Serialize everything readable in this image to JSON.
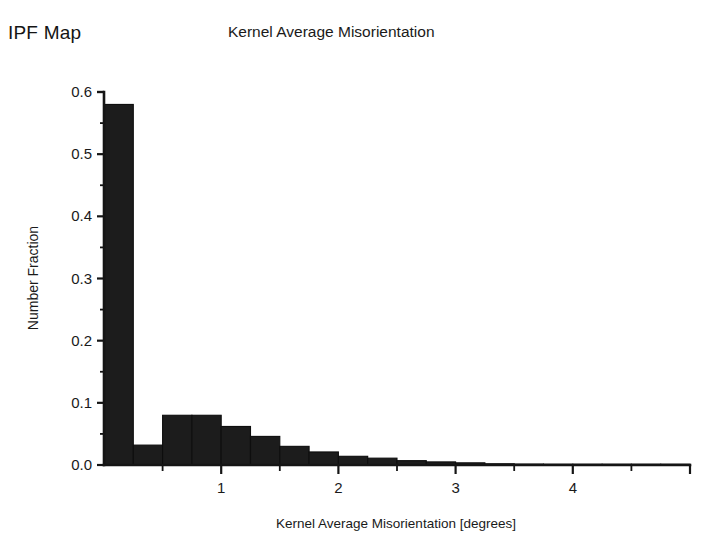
{
  "figure": {
    "panel_label": "IPF Map",
    "title": "Kernel Average Misorientation"
  },
  "chart_data": {
    "type": "bar",
    "title": "Kernel Average Misorientation",
    "xlabel": "Kernel Average Misorientation [degrees]",
    "ylabel": "Number Fraction",
    "xlim": [
      0,
      5
    ],
    "ylim": [
      0,
      0.6
    ],
    "grid": false,
    "legend": null,
    "bar_width": 0.25,
    "x_major_ticks": [
      1,
      2,
      3,
      4
    ],
    "x_major_tick_labels": [
      "1",
      "2",
      "3",
      "4"
    ],
    "x_minor_ticks": [
      0.5,
      1.5,
      2.5,
      3.5,
      4.5
    ],
    "y_major_ticks": [
      0.0,
      0.1,
      0.2,
      0.3,
      0.4,
      0.5,
      0.6
    ],
    "y_major_tick_labels": [
      "0.0",
      "0.1",
      "0.2",
      "0.3",
      "0.4",
      "0.5",
      "0.6"
    ],
    "y_minor_ticks": [
      0.05,
      0.15,
      0.25,
      0.35,
      0.45,
      0.55
    ],
    "bin_edges": [
      0.0,
      0.25,
      0.5,
      0.75,
      1.0,
      1.25,
      1.5,
      1.75,
      2.0,
      2.25,
      2.5,
      2.75,
      3.0,
      3.25,
      3.5,
      3.75,
      4.0,
      4.25,
      4.5,
      4.75,
      5.0
    ],
    "categories": [
      "0.125",
      "0.375",
      "0.625",
      "0.875",
      "1.125",
      "1.375",
      "1.625",
      "1.875",
      "2.125",
      "2.375",
      "2.625",
      "2.875",
      "3.125",
      "3.375",
      "3.625",
      "3.875",
      "4.125",
      "4.375",
      "4.625",
      "4.875"
    ],
    "values": [
      0.58,
      0.032,
      0.08,
      0.08,
      0.062,
      0.046,
      0.03,
      0.021,
      0.014,
      0.011,
      0.007,
      0.005,
      0.0035,
      0.002,
      0.0015,
      0.001,
      0.0008,
      0.0005,
      0.0004,
      0.0003
    ],
    "bar_color": "#1c1c1c"
  }
}
